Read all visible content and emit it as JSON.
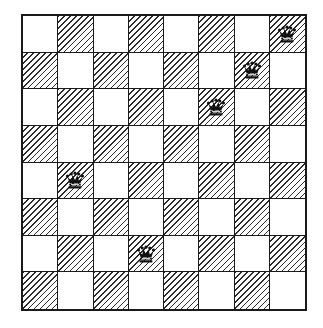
{
  "board": {
    "rows": 8,
    "cols": 8,
    "top_left_square": "light",
    "dark_pattern": "diagonal-hatch",
    "colors": {
      "light": "#ffffff",
      "hatch": "#2a2a2a",
      "border": "#1a1a1a"
    }
  },
  "pieces": [
    {
      "type": "queen",
      "icon": "queen-icon",
      "row": 0,
      "col": 7
    },
    {
      "type": "queen",
      "icon": "queen-icon",
      "row": 1,
      "col": 6
    },
    {
      "type": "queen",
      "icon": "queen-icon",
      "row": 2,
      "col": 5
    },
    {
      "type": "queen",
      "icon": "queen-icon",
      "row": 4,
      "col": 1
    },
    {
      "type": "queen",
      "icon": "queen-icon",
      "row": 6,
      "col": 3
    }
  ]
}
